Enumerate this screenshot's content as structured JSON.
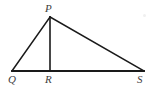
{
  "figure": {
    "type": "geometry-diagram",
    "background_color": "#ffffff",
    "stroke_color": "#1a1a1a",
    "label_color": "#3d3d3d",
    "canvas": {
      "width": 156,
      "height": 88
    },
    "points": {
      "P": {
        "label": "P",
        "x": 50,
        "y": 17
      },
      "Q": {
        "label": "Q",
        "x": 12,
        "y": 71
      },
      "R": {
        "label": "R",
        "x": 50,
        "y": 71
      },
      "S": {
        "label": "S",
        "x": 144,
        "y": 71
      }
    },
    "segments": [
      {
        "name": "QP",
        "from": "Q",
        "to": "P",
        "stroke_width": 1.6
      },
      {
        "name": "PS",
        "from": "P",
        "to": "S",
        "stroke_width": 1.6
      },
      {
        "name": "QS",
        "from": "Q",
        "to": "S",
        "stroke_width": 1.8
      },
      {
        "name": "PR",
        "from": "P",
        "to": "R",
        "stroke_width": 1.6
      }
    ],
    "labels": {
      "P": "P",
      "Q": "Q",
      "R": "R",
      "S": "S"
    }
  }
}
